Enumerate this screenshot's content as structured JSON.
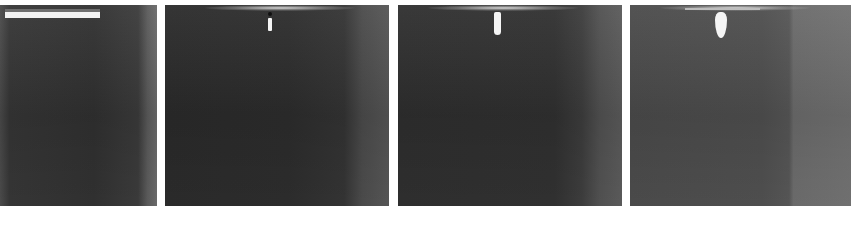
{
  "figure": {
    "panels": [
      {
        "index": 1,
        "content": "horizontal bright nozzle bar at top-left, no droplet"
      },
      {
        "index": 2,
        "content": "small thin droplet emerging below nozzle tip"
      },
      {
        "index": 3,
        "content": "elongated droplet hanging from nozzle"
      },
      {
        "index": 4,
        "content": "larger pear-shaped droplet hanging from nozzle"
      }
    ],
    "captions": [
      "",
      "",
      "",
      ""
    ]
  }
}
